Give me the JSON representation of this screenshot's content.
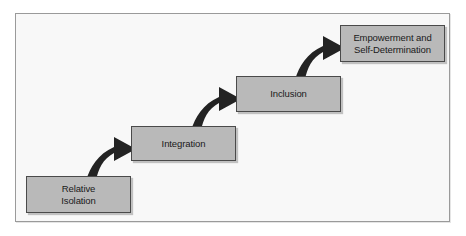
{
  "diagram": {
    "type": "ascending-stair-flow",
    "background_color": "#f8f8f8",
    "frame_border_color": "#9a9a9a",
    "box_fill_color": "#b9b9b9",
    "box_border_color": "#4a4a4a",
    "arrow_color": "#232323",
    "text_color": "#1a1a1a",
    "steps": [
      {
        "id": "relative-isolation",
        "label": "Relative\nIsolation",
        "order": 1
      },
      {
        "id": "integration",
        "label": "Integration",
        "order": 2
      },
      {
        "id": "inclusion",
        "label": "Inclusion",
        "order": 3
      },
      {
        "id": "empowerment",
        "label": "Empowerment and\nSelf-Determination",
        "order": 4
      }
    ],
    "connectors": [
      {
        "id": "arrow-1",
        "icon": "curved-arrow-up-right-icon",
        "from": "relative-isolation",
        "to": "integration"
      },
      {
        "id": "arrow-2",
        "icon": "curved-arrow-up-right-icon",
        "from": "integration",
        "to": "inclusion"
      },
      {
        "id": "arrow-3",
        "icon": "curved-arrow-up-right-icon",
        "from": "inclusion",
        "to": "empowerment"
      }
    ]
  }
}
